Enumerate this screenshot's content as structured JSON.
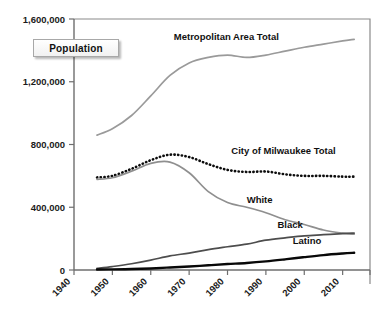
{
  "badge": {
    "label": "Population"
  },
  "chart_data": {
    "type": "line",
    "title": "",
    "xlabel": "",
    "ylabel": "Population",
    "xlim": [
      1940,
      2014
    ],
    "ylim": [
      0,
      1600000
    ],
    "grid": false,
    "legend": "inline-labels",
    "x_ticks": [
      1940,
      1950,
      1960,
      1970,
      1980,
      1990,
      2000,
      2010
    ],
    "x_tick_labels": [
      "1940",
      "1950",
      "1960",
      "1970",
      "1980",
      "1990",
      "2000",
      "2010"
    ],
    "y_ticks": [
      0,
      400000,
      800000,
      1200000,
      1600000
    ],
    "y_tick_labels": [
      "0",
      "400,000",
      "800,000",
      "1,200,000",
      "1,600,000"
    ],
    "series": [
      {
        "name": "Metropolitan Area Total",
        "label": "Metropolitan Area Total",
        "style": "solid-gray",
        "color": "#9a9a9a",
        "label_x": 1966,
        "label_y": 1465000,
        "x": [
          1946,
          1950,
          1955,
          1960,
          1965,
          1970,
          1975,
          1980,
          1985,
          1990,
          1995,
          2000,
          2005,
          2010,
          2013
        ],
        "values": [
          860000,
          900000,
          985000,
          1110000,
          1240000,
          1320000,
          1355000,
          1370000,
          1355000,
          1370000,
          1395000,
          1420000,
          1440000,
          1460000,
          1470000
        ]
      },
      {
        "name": "City of Milwaukee Total",
        "label": "City of Milwaukee Total",
        "style": "dotted-black",
        "color": "#0d0d0d",
        "label_x": 1981,
        "label_y": 740000,
        "x": [
          1946,
          1950,
          1955,
          1960,
          1965,
          1970,
          1975,
          1980,
          1985,
          1990,
          1995,
          2000,
          2005,
          2010,
          2013
        ],
        "values": [
          590000,
          600000,
          645000,
          700000,
          735000,
          720000,
          675000,
          638000,
          625000,
          628000,
          610000,
          600000,
          600000,
          595000,
          595000
        ]
      },
      {
        "name": "White",
        "label": "White",
        "style": "solid-gray",
        "color": "#8f8f8f",
        "label_x": 1985,
        "label_y": 430000,
        "x": [
          1946,
          1950,
          1955,
          1960,
          1965,
          1970,
          1975,
          1980,
          1985,
          1990,
          1995,
          2000,
          2005,
          2010,
          2013
        ],
        "values": [
          578000,
          588000,
          630000,
          680000,
          688000,
          620000,
          500000,
          430000,
          400000,
          365000,
          320000,
          290000,
          255000,
          235000,
          228000
        ]
      },
      {
        "name": "Black",
        "label": "Black",
        "style": "solid-darkgray",
        "color": "#4d4d4d",
        "label_x": 1993,
        "label_y": 270000,
        "x": [
          1946,
          1950,
          1955,
          1960,
          1965,
          1970,
          1975,
          1980,
          1985,
          1990,
          1995,
          2000,
          2005,
          2010,
          2013
        ],
        "values": [
          10000,
          22000,
          40000,
          63000,
          90000,
          108000,
          130000,
          148000,
          165000,
          190000,
          205000,
          218000,
          225000,
          232000,
          235000
        ]
      },
      {
        "name": "Latino",
        "label": "Latino",
        "style": "solid-black",
        "color": "#080808",
        "label_x": 1997,
        "label_y": 165000,
        "x": [
          1946,
          1950,
          1955,
          1960,
          1965,
          1970,
          1975,
          1980,
          1985,
          1990,
          1995,
          2000,
          2005,
          2010,
          2013
        ],
        "values": [
          3000,
          4000,
          6000,
          10000,
          16000,
          22000,
          30000,
          38000,
          45000,
          55000,
          68000,
          82000,
          95000,
          105000,
          110000
        ]
      }
    ]
  }
}
